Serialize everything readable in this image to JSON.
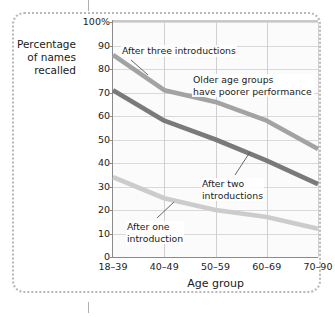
{
  "chart_data": {
    "type": "line",
    "title": "",
    "xlabel": "Age group",
    "ylabel": "Percentage of names recalled",
    "ylabel_lines": [
      "Percentage",
      "of names",
      "recalled"
    ],
    "categories": [
      "18–39",
      "40–49",
      "50–59",
      "60–69",
      "70–90"
    ],
    "ylim": [
      0,
      100
    ],
    "ytick_labels": [
      "0",
      "10",
      "20",
      "30",
      "40",
      "50",
      "60",
      "70",
      "80",
      "90",
      "100%"
    ],
    "ytick_values": [
      0,
      10,
      20,
      30,
      40,
      50,
      60,
      70,
      80,
      90,
      100
    ],
    "grid": true,
    "legend": "none",
    "series": [
      {
        "name": "After three introductions",
        "color": "#a3a3a3",
        "values": [
          86,
          71,
          66,
          58,
          46
        ]
      },
      {
        "name": "After two introductions",
        "color": "#7a7a7a",
        "values": [
          71,
          58,
          50,
          41,
          31
        ]
      },
      {
        "name": "After one introduction",
        "color": "#cccccc",
        "values": [
          34,
          25,
          20,
          17,
          12
        ]
      }
    ],
    "annotations": [
      {
        "id": "three",
        "lines": [
          "After three introductions"
        ],
        "target_series": "After three introductions"
      },
      {
        "id": "older",
        "lines": [
          "Older age groups",
          "have poorer performance"
        ],
        "target_series": ""
      },
      {
        "id": "two",
        "lines": [
          "After two",
          "introductions"
        ],
        "target_series": "After two introductions"
      },
      {
        "id": "one",
        "lines": [
          "After one",
          "introduction"
        ],
        "target_series": "After one introduction"
      }
    ]
  },
  "colors": {
    "frame": "#b8b8b8",
    "grid": "#d9d9d9",
    "axis": "#8a8a8a",
    "text": "#1a1a1a",
    "plot_background": "#fbfbfb"
  }
}
